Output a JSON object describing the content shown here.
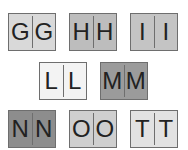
{
  "cards": [
    {
      "left": "G",
      "right": "G",
      "x": 8,
      "y": 13,
      "bg": "#d9d9d9"
    },
    {
      "left": "H",
      "right": "H",
      "x": 69,
      "y": 13,
      "bg": "#bdbdbd"
    },
    {
      "left": "I",
      "right": "I",
      "x": 130,
      "y": 13,
      "bg": "#c4c4c4"
    },
    {
      "left": "L",
      "right": "L",
      "x": 39,
      "y": 62,
      "bg": "#f3f3f3"
    },
    {
      "left": "M",
      "right": "M",
      "x": 100,
      "y": 62,
      "bg": "#9b9b9b"
    },
    {
      "left": "N",
      "right": "N",
      "x": 8,
      "y": 110,
      "bg": "#8d8d8d"
    },
    {
      "left": "O",
      "right": "O",
      "x": 69,
      "y": 110,
      "bg": "#cfcfcf"
    },
    {
      "left": "T",
      "right": "T",
      "x": 130,
      "y": 110,
      "bg": "#e2e2e2"
    }
  ]
}
